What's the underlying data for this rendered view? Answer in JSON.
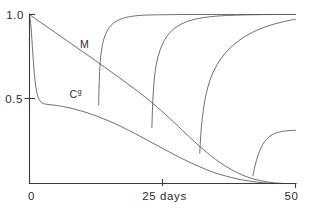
{
  "chart_data": {
    "type": "line",
    "title": "",
    "subtitle": "",
    "xlabel": "25 days",
    "ylabel": "",
    "xlim": [
      0,
      50
    ],
    "ylim": [
      0,
      1.0
    ],
    "grid": false,
    "legend": "none",
    "xticks": [
      0,
      25,
      50
    ],
    "xticklabels": [
      "0",
      "25 days",
      "50"
    ],
    "yticks": [
      0,
      0.5,
      1.0
    ],
    "yticklabels": [
      "0",
      "0.5",
      "1.0"
    ],
    "annotations": [
      {
        "text": "M",
        "x": 9.5,
        "y": 0.8
      },
      {
        "text": "C",
        "sup": "g",
        "x": 7.5,
        "y": 0.505
      }
    ],
    "series": [
      {
        "name": "M",
        "label": "M",
        "description": "monotone decay from 1.0 at day 0 to 0 near day 47",
        "points": [
          [
            0,
            1.0
          ],
          [
            2,
            0.955
          ],
          [
            4,
            0.912
          ],
          [
            6,
            0.868
          ],
          [
            8,
            0.824
          ],
          [
            10,
            0.78
          ],
          [
            12,
            0.736
          ],
          [
            14,
            0.691
          ],
          [
            16,
            0.646
          ],
          [
            18,
            0.6
          ],
          [
            20,
            0.554
          ],
          [
            22,
            0.505
          ],
          [
            24,
            0.452
          ],
          [
            26,
            0.396
          ],
          [
            28,
            0.337
          ],
          [
            30,
            0.277
          ],
          [
            32,
            0.219
          ],
          [
            34,
            0.166
          ],
          [
            36,
            0.12
          ],
          [
            38,
            0.081
          ],
          [
            40,
            0.05
          ],
          [
            42,
            0.028
          ],
          [
            44,
            0.013
          ],
          [
            46,
            0.004
          ],
          [
            48,
            0.0
          ],
          [
            50,
            0.0
          ]
        ]
      },
      {
        "name": "Cg",
        "label": "C",
        "sup": "g",
        "description": "sharp drop from 1.0 to 0.47 within first 2 days, slow decay to 0 near day 46",
        "points": [
          [
            0,
            1.0
          ],
          [
            0.3,
            0.92
          ],
          [
            0.6,
            0.78
          ],
          [
            0.9,
            0.655
          ],
          [
            1.2,
            0.572
          ],
          [
            1.5,
            0.523
          ],
          [
            1.9,
            0.492
          ],
          [
            2.4,
            0.476
          ],
          [
            3.0,
            0.47
          ],
          [
            4.0,
            0.466
          ],
          [
            5.0,
            0.462
          ],
          [
            6.0,
            0.457
          ],
          [
            8.0,
            0.444
          ],
          [
            10.0,
            0.427
          ],
          [
            12.0,
            0.406
          ],
          [
            14.0,
            0.382
          ],
          [
            16.0,
            0.355
          ],
          [
            18.0,
            0.325
          ],
          [
            20.0,
            0.293
          ],
          [
            22.0,
            0.259
          ],
          [
            24.0,
            0.225
          ],
          [
            26.0,
            0.191
          ],
          [
            28.0,
            0.158
          ],
          [
            30.0,
            0.127
          ],
          [
            32.0,
            0.099
          ],
          [
            34.0,
            0.073
          ],
          [
            36.0,
            0.052
          ],
          [
            38.0,
            0.035
          ],
          [
            40.0,
            0.021
          ],
          [
            42.0,
            0.011
          ],
          [
            44.0,
            0.004
          ],
          [
            46.0,
            0.0
          ],
          [
            50.0,
            0.0
          ]
        ]
      },
      {
        "name": "burst-1",
        "description": "first rapid rise beginning near day 13 from 0.47 to plateau 1.0",
        "points": [
          [
            13.0,
            0.465
          ],
          [
            13.1,
            0.6
          ],
          [
            13.3,
            0.72
          ],
          [
            13.6,
            0.8
          ],
          [
            14.0,
            0.857
          ],
          [
            14.6,
            0.903
          ],
          [
            15.4,
            0.938
          ],
          [
            16.4,
            0.962
          ],
          [
            17.6,
            0.978
          ],
          [
            19.0,
            0.988
          ],
          [
            21.0,
            0.995
          ],
          [
            24.0,
            0.998
          ],
          [
            30.0,
            1.0
          ],
          [
            40.0,
            1.0
          ],
          [
            50.0,
            1.0
          ]
        ]
      },
      {
        "name": "burst-2",
        "description": "second rapid rise beginning near day 23 from 0.33 to plateau 1.0",
        "points": [
          [
            23.0,
            0.33
          ],
          [
            23.2,
            0.5
          ],
          [
            23.5,
            0.63
          ],
          [
            23.9,
            0.715
          ],
          [
            24.5,
            0.786
          ],
          [
            25.3,
            0.845
          ],
          [
            26.4,
            0.893
          ],
          [
            27.8,
            0.93
          ],
          [
            29.5,
            0.957
          ],
          [
            31.5,
            0.975
          ],
          [
            34.0,
            0.987
          ],
          [
            37.0,
            0.994
          ],
          [
            41.0,
            0.998
          ],
          [
            46.0,
            1.0
          ],
          [
            50.0,
            1.0
          ]
        ]
      },
      {
        "name": "burst-3",
        "description": "third rapid rise beginning near day 32 from 0.18 to plateau near 0.98",
        "points": [
          [
            32.0,
            0.18
          ],
          [
            32.3,
            0.33
          ],
          [
            32.8,
            0.46
          ],
          [
            33.4,
            0.555
          ],
          [
            34.2,
            0.635
          ],
          [
            35.3,
            0.705
          ],
          [
            36.7,
            0.768
          ],
          [
            38.4,
            0.822
          ],
          [
            40.4,
            0.868
          ],
          [
            42.6,
            0.905
          ],
          [
            45.0,
            0.934
          ],
          [
            47.4,
            0.955
          ],
          [
            50.0,
            0.972
          ]
        ]
      },
      {
        "name": "burst-4",
        "description": "fourth rapid rise beginning near day 42 from 0.045 to plateau 0.315",
        "points": [
          [
            42.0,
            0.045
          ],
          [
            42.4,
            0.105
          ],
          [
            42.9,
            0.162
          ],
          [
            43.5,
            0.21
          ],
          [
            44.2,
            0.248
          ],
          [
            45.1,
            0.278
          ],
          [
            46.2,
            0.297
          ],
          [
            47.5,
            0.308
          ],
          [
            48.8,
            0.313
          ],
          [
            50.0,
            0.315
          ]
        ]
      }
    ]
  }
}
